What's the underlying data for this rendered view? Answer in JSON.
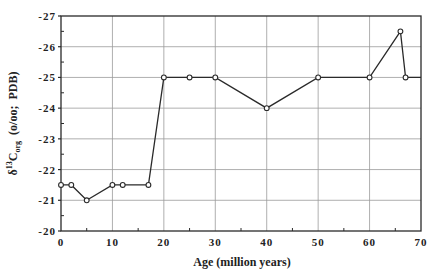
{
  "chart_data": {
    "type": "line",
    "title": "",
    "xlabel": "Age (million years)",
    "ylabel_prefix": "δ",
    "ylabel_sup": "13",
    "ylabel_main": "C",
    "ylabel_sub": "org",
    "ylabel_suffix": "  (o/oo;  PDB)",
    "ylabel": "δ13Corg (o/oo; PDB)",
    "xlim": [
      0,
      70
    ],
    "ylim": [
      -20,
      -27
    ],
    "y_inverted": true,
    "x_ticks": [
      0,
      10,
      20,
      30,
      40,
      50,
      60,
      70
    ],
    "y_ticks": [
      -20,
      -21,
      -22,
      -23,
      -24,
      -25,
      -26,
      -27
    ],
    "x_tick_labels": [
      "0",
      "10",
      "20",
      "30",
      "40",
      "50",
      "60",
      "70"
    ],
    "y_tick_labels": [
      "-20",
      "-21",
      "-22",
      "-23",
      "-24",
      "-25",
      "-26",
      "-27"
    ],
    "grid": true,
    "legend": null,
    "series": [
      {
        "name": "δ13Corg",
        "marker": "open-circle",
        "x": [
          0,
          2,
          5,
          10,
          12,
          17,
          20,
          25,
          30,
          40,
          50,
          60,
          66,
          67
        ],
        "y": [
          -21.5,
          -21.5,
          -21.0,
          -21.5,
          -21.5,
          -21.5,
          -25.0,
          -25.0,
          -25.0,
          -24.0,
          -25.0,
          -25.0,
          -26.5,
          -25.0
        ],
        "line_extends_to_x": 70,
        "line_extends_to_y": -25.0
      }
    ]
  }
}
